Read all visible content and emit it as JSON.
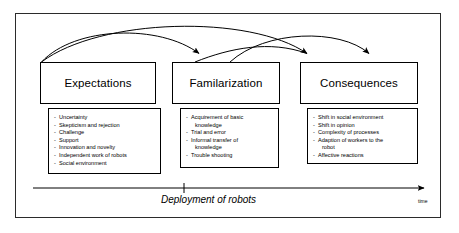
{
  "diagram": {
    "timeline": {
      "label": "Deployment of robots",
      "axis_label": "time",
      "tick_present": true
    },
    "stages": [
      {
        "id": "expectations",
        "title": "Expectations",
        "items": [
          {
            "text": "Uncertainty",
            "continuation": false
          },
          {
            "text": "Skepticism and rejection",
            "continuation": false
          },
          {
            "text": "Challenge",
            "continuation": false
          },
          {
            "text": "Support",
            "continuation": false
          },
          {
            "text": "Innovation and novelty",
            "continuation": false
          },
          {
            "text": "Independent work of robots",
            "continuation": false
          },
          {
            "text": "Social environment",
            "continuation": false
          }
        ]
      },
      {
        "id": "familarization",
        "title": "Familarization",
        "items": [
          {
            "text": "Acquirement of basic",
            "continuation": false
          },
          {
            "text": "knowledge",
            "continuation": true
          },
          {
            "text": "Trial and error",
            "continuation": false
          },
          {
            "text": "Informal transfer of",
            "continuation": false
          },
          {
            "text": "knowledge",
            "continuation": true
          },
          {
            "text": "Trouble shooting",
            "continuation": false
          }
        ]
      },
      {
        "id": "consequences",
        "title": "Consequences",
        "items": [
          {
            "text": "Shift in social environment",
            "continuation": false
          },
          {
            "text": "Shift in opinion",
            "continuation": false
          },
          {
            "text": "Complexity of processes",
            "continuation": false
          },
          {
            "text": "Adaption of workers to the",
            "continuation": false
          },
          {
            "text": "robot",
            "continuation": true
          },
          {
            "text": "Affective reactions",
            "continuation": false
          }
        ]
      }
    ],
    "arrows": [
      {
        "id": "expectations-to-familarization",
        "from": "expectations",
        "to": "familarization"
      },
      {
        "id": "expectations-to-consequences",
        "from": "expectations",
        "to": "consequences"
      },
      {
        "id": "familarization-to-consequences",
        "from": "familarization",
        "to": "consequences"
      },
      {
        "id": "consequences-to-expectations",
        "from": "consequences",
        "to": "expectations"
      }
    ],
    "colors": {
      "stroke": "#000000",
      "frame": "#2b2b2b",
      "background": "#ffffff"
    }
  }
}
